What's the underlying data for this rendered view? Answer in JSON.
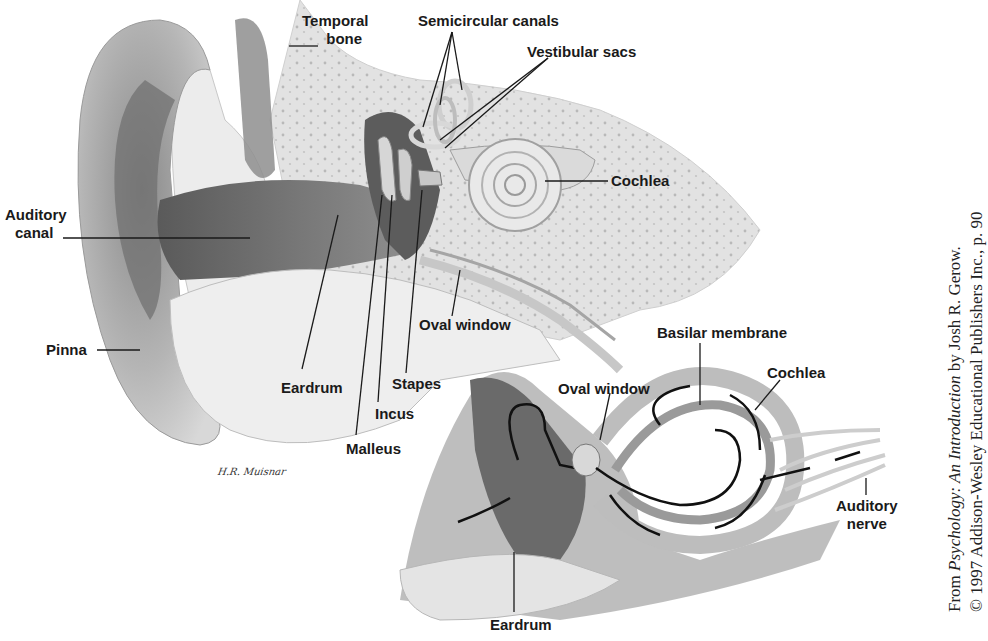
{
  "figure": {
    "type": "anatomical-diagram",
    "colors": {
      "ink": "#1a1a1a",
      "background": "#ffffff",
      "tissue_dark": "#6e6e6e",
      "tissue_mid": "#a8a8a8",
      "tissue_light": "#dcdcdc"
    }
  },
  "upper_view": {
    "labels": {
      "temporal_bone_line1": "Temporal",
      "temporal_bone_line2": "bone",
      "semicircular_canals": "Semicircular canals",
      "vestibular_sacs": "Vestibular sacs",
      "cochlea": "Cochlea",
      "auditory_canal_line1": "Auditory",
      "auditory_canal_line2": "canal",
      "pinna": "Pinna",
      "oval_window": "Oval window",
      "eardrum": "Eardrum",
      "stapes": "Stapes",
      "incus": "Incus",
      "malleus": "Malleus"
    },
    "signature": "H.R. Muisnar"
  },
  "lower_view": {
    "labels": {
      "oval_window": "Oval window",
      "basilar_membrane": "Basilar membrane",
      "cochlea": "Cochlea",
      "auditory_nerve_line1": "Auditory",
      "auditory_nerve_line2": "nerve",
      "eardrum": "Eardrum"
    }
  },
  "credit": {
    "line1_prefix": "From ",
    "line1_title": "Psychology: An Introduction",
    "line1_suffix": " by Josh R. Gerow.",
    "line2": "© 1997 Addison-Wesley Educational Publishers Inc., p. 90"
  }
}
